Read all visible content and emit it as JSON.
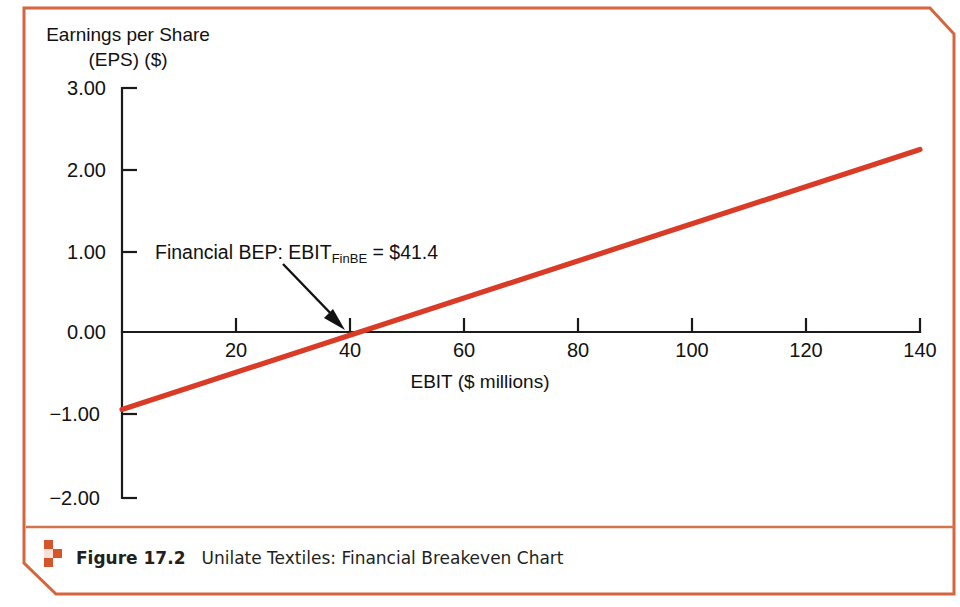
{
  "figure": {
    "caption_label": "Figure 17.2",
    "caption_title": "Unilate Textiles: Financial Breakeven Chart",
    "frame_color": "#d4653f",
    "divider_color": "#d4744a",
    "mark_color": "#d4552b"
  },
  "chart_data": {
    "type": "line",
    "title": "",
    "xlabel": "EBIT ($ millions)",
    "ylabel": "Earnings per Share (EPS) ($)",
    "ylabel_line1": "Earnings per Share",
    "ylabel_line2": "(EPS) ($)",
    "xlim": [
      0,
      140
    ],
    "ylim": [
      -2.0,
      3.0
    ],
    "xticks": [
      20,
      40,
      60,
      80,
      100,
      120,
      140
    ],
    "xtick_labels": [
      "20",
      "40",
      "60",
      "80",
      "100",
      "120",
      "140"
    ],
    "yticks": [
      3.0,
      2.0,
      1.0,
      0.0,
      -1.0,
      -2.0
    ],
    "ytick_labels": [
      "3.00",
      "2.00",
      "1.00",
      "0.00",
      "−1.00",
      "−2.00"
    ],
    "grid": false,
    "legend": null,
    "series": [
      {
        "name": "EPS",
        "color": "#d93b26",
        "x": [
          0,
          140
        ],
        "y": [
          -0.92,
          2.25
        ]
      }
    ],
    "annotations": [
      {
        "name": "financial-bep",
        "text_prefix": "Financial BEP: EBIT",
        "text_subscript": "FinBE",
        "text_suffix": " = $41.4",
        "full_text": "Financial BEP: EBIT FinBE = $41.4",
        "point_x": 41.4,
        "point_y": 0.0
      }
    ]
  }
}
